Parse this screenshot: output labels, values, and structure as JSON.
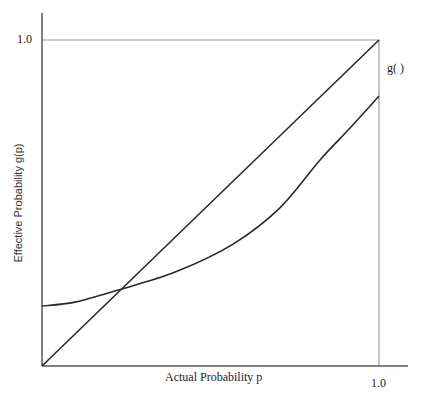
{
  "chart_data": {
    "type": "line",
    "title": "",
    "xlabel": "Actual Probability  p",
    "ylabel": "Effective Probability g(p)",
    "xlim": [
      0,
      1
    ],
    "ylim": [
      0,
      1
    ],
    "x_ticks": [
      {
        "value": 1.0,
        "label": "1.0"
      }
    ],
    "y_ticks": [
      {
        "value": 1.0,
        "label": "1.0"
      }
    ],
    "grid": false,
    "legend": "none",
    "series": [
      {
        "name": "identity",
        "x": [
          0,
          1
        ],
        "y": [
          0,
          1
        ]
      },
      {
        "name": "g( )",
        "x": [
          0.0,
          0.098,
          0.226,
          0.395,
          0.567,
          0.706,
          0.825,
          0.914,
          1.0
        ],
        "y": [
          0.184,
          0.196,
          0.233,
          0.288,
          0.374,
          0.485,
          0.632,
          0.73,
          0.828
        ]
      }
    ],
    "annotations": [
      {
        "text": "g( )",
        "attached_to": "g( )",
        "position": "right end of curve"
      }
    ],
    "reference_lines": [
      {
        "type": "horizontal",
        "y": 1.0,
        "x_range": [
          0,
          1
        ]
      },
      {
        "type": "vertical",
        "x": 1.0,
        "y_range": [
          0,
          1
        ]
      }
    ]
  },
  "labels": {
    "y_tick": "1.0",
    "x_tick": "1.0",
    "curve_label": "g( )",
    "xlabel": "Actual Probability  p",
    "ylabel": "Effective Probability g(p)"
  },
  "colors": {
    "axis": "#555555",
    "reference": "#9a9a9a",
    "line": "#2a2a2a"
  }
}
